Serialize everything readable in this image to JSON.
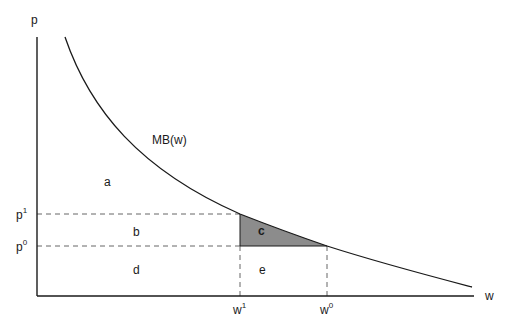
{
  "axes": {
    "y_label": "p",
    "x_label": "w"
  },
  "curve": {
    "label": "MB(w)"
  },
  "price_ticks": [
    {
      "base": "p",
      "sup": "1"
    },
    {
      "base": "p",
      "sup": "0"
    }
  ],
  "quantity_ticks": [
    {
      "base": "w",
      "sup": "1"
    },
    {
      "base": "w",
      "sup": "0"
    }
  ],
  "regions": {
    "a": "a",
    "b": "b",
    "c": "c",
    "d": "d",
    "e": "e"
  },
  "colors": {
    "axis": "#1a1a1a",
    "curve": "#1a1a1a",
    "dashed": "#555555",
    "shaded_region": "#8c8c8c",
    "background": "#ffffff"
  }
}
